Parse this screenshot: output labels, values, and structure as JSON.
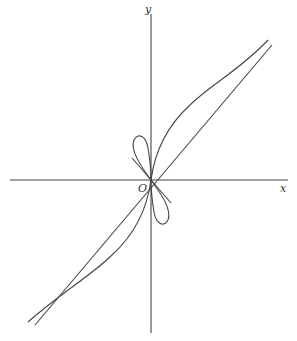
{
  "diagram": {
    "type": "mathematical-curve-plot",
    "axes": {
      "x_label": "x",
      "y_label": "y",
      "origin_label": "O"
    },
    "elements": [
      {
        "name": "x-axis",
        "description": "horizontal axis"
      },
      {
        "name": "y-axis",
        "description": "vertical axis"
      },
      {
        "name": "asymptote-line",
        "description": "diagonal line y = x through origin"
      },
      {
        "name": "tangent-line",
        "description": "short line of slope -1 through origin"
      },
      {
        "name": "s-curve",
        "description": "curve through origin, vertical tangent at O, approaching y = x asymptotically"
      },
      {
        "name": "loop-upper-left",
        "description": "petal loop in second quadrant along y = -x"
      },
      {
        "name": "loop-lower-right",
        "description": "petal loop in fourth quadrant along y = -x"
      }
    ],
    "colors": {
      "stroke": "#444444",
      "background": "#ffffff"
    }
  }
}
